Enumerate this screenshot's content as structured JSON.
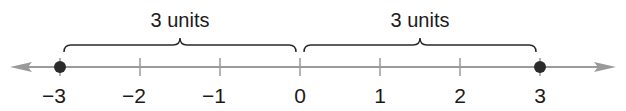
{
  "number_line": {
    "min": -3,
    "max": 3,
    "ticks": [
      {
        "value": -3,
        "label": "−3"
      },
      {
        "value": -2,
        "label": "−2"
      },
      {
        "value": -1,
        "label": "−1"
      },
      {
        "value": 0,
        "label": "0"
      },
      {
        "value": 1,
        "label": "1"
      },
      {
        "value": 2,
        "label": "2"
      },
      {
        "value": 3,
        "label": "3"
      }
    ],
    "points": [
      -3,
      3
    ],
    "braces": [
      {
        "from": -3,
        "to": 0,
        "label": "3 units"
      },
      {
        "from": 0,
        "to": 3,
        "label": "3 units"
      }
    ],
    "arrows": [
      "left",
      "right"
    ],
    "colors": {
      "line": "#9a9a9a",
      "point": "#2a2a2a",
      "text": "#1a1a1a"
    }
  }
}
